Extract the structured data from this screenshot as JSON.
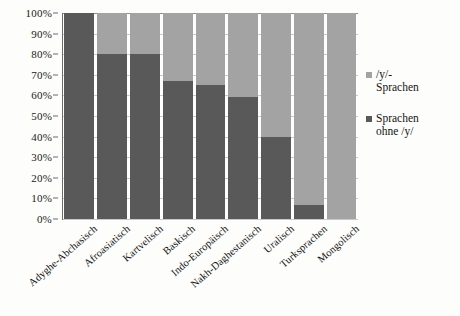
{
  "chart_data": {
    "type": "bar",
    "subtype": "stacked-100-percent",
    "title": "",
    "xlabel": "",
    "ylabel": "",
    "ylim": [
      0,
      100
    ],
    "y_tick_labels": [
      "100%",
      "90%",
      "80%",
      "70%",
      "60%",
      "50%",
      "40%",
      "30%",
      "20%",
      "10%",
      "0%"
    ],
    "y_tick_values": [
      100,
      90,
      80,
      70,
      60,
      50,
      40,
      30,
      20,
      10,
      0
    ],
    "grid": true,
    "legend_position": "right",
    "categories": [
      "Adyghe-Abchasisch",
      "Afroasiatisch",
      "Kartvelisch",
      "Baskisch",
      "Indo-Europäisch",
      "Nakh-Daghestanisch",
      "Uralisch",
      "Turksprachen",
      "Mongolisch"
    ],
    "series": [
      {
        "name": "Sprachen ohne /y/",
        "color": "#595959",
        "values": [
          100,
          80,
          80,
          67,
          65,
          59,
          40,
          7,
          0
        ]
      },
      {
        "name": "/y/-Sprachen",
        "color": "#a3a3a3",
        "values": [
          0,
          20,
          20,
          33,
          35,
          41,
          60,
          93,
          100
        ]
      }
    ]
  },
  "legend": {
    "entries": [
      {
        "label": "/y/-\nSprachen",
        "color": "#a3a3a3"
      },
      {
        "label": "Sprachen\nohne  /y/",
        "color": "#595959"
      }
    ]
  },
  "colors": {
    "dark_gray": "#595959",
    "light_gray": "#a3a3a3",
    "axis": "#6b6b6b",
    "gridline": "#c9c9c9",
    "background": "#fdfdfc"
  }
}
